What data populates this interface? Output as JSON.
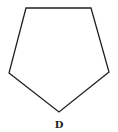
{
  "diagram": {
    "shape": "pentagon",
    "stroke_color": "#222222",
    "fill_color": "none",
    "label": "D"
  }
}
